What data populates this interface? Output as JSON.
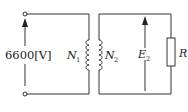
{
  "diagram": {
    "type": "transformer-circuit",
    "primary": {
      "voltage_label": "6600[V]",
      "winding_label": "N",
      "winding_sub": "1"
    },
    "secondary": {
      "winding_label": "N",
      "winding_sub": "2",
      "emf_label": "E",
      "emf_sub": "2",
      "load_label": "R"
    },
    "colors": {
      "line": "#333333",
      "background": "#ffffff"
    }
  }
}
